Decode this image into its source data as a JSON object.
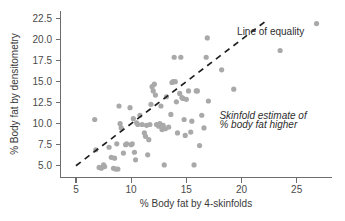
{
  "chart_data": {
    "type": "scatter",
    "title": "",
    "xlabel": "% Body fat by 4-skinfolds",
    "ylabel": "% Body fat by densitometry",
    "xlim": [
      3.6,
      28.2
    ],
    "ylim": [
      3.6,
      23.4
    ],
    "xticks": [
      5,
      10,
      15,
      20,
      25
    ],
    "xticklabels": [
      "5",
      "10",
      "15",
      "20",
      "25"
    ],
    "yticks": [
      5.0,
      7.5,
      10.0,
      12.5,
      15.0,
      17.5,
      20.0,
      22.5
    ],
    "yticklabels": [
      "5.0",
      "7.5",
      "10.0",
      "12.5",
      "15.0",
      "17.5",
      "20.0",
      "22.5"
    ],
    "grid": false,
    "legend": false,
    "marker_color": "#a9a9a9",
    "marker_size_px": 5.2,
    "annotations": [
      {
        "name": "line-of-equality-label",
        "text": "Line of equality",
        "x": 19.6,
        "y": 20.6,
        "style": "normal"
      },
      {
        "name": "skinfold-note-line-1",
        "text": "Skinfold estimate of",
        "x": 18.0,
        "y": 10.6,
        "style": "italic"
      },
      {
        "name": "skinfold-note-line-2",
        "text": "% body fat higher",
        "x": 18.0,
        "y": 9.5,
        "style": "italic"
      }
    ],
    "reference_line": {
      "name": "line-of-equality",
      "label": "Line of equality",
      "style": "dashed",
      "color": "#1f1f1f",
      "x_start": 5.0,
      "y_start": 5.0,
      "x_end": 22.4,
      "y_end": 22.4
    },
    "points": [
      [
        6.7,
        10.5
      ],
      [
        6.8,
        6.9
      ],
      [
        7.1,
        4.8
      ],
      [
        7.3,
        4.7
      ],
      [
        7.5,
        5.1
      ],
      [
        7.6,
        4.9
      ],
      [
        8.0,
        7.2
      ],
      [
        8.2,
        6.0
      ],
      [
        8.4,
        4.7
      ],
      [
        8.5,
        5.9
      ],
      [
        8.6,
        4.6
      ],
      [
        8.7,
        7.6
      ],
      [
        8.8,
        4.6
      ],
      [
        8.9,
        12.1
      ],
      [
        9.0,
        10.0
      ],
      [
        9.1,
        9.5
      ],
      [
        9.3,
        6.5
      ],
      [
        9.5,
        7.5
      ],
      [
        9.6,
        7.6
      ],
      [
        9.9,
        11.9
      ],
      [
        10.0,
        7.5
      ],
      [
        10.1,
        7.6
      ],
      [
        10.2,
        10.6
      ],
      [
        10.3,
        6.6
      ],
      [
        10.4,
        5.7
      ],
      [
        10.5,
        10.1
      ],
      [
        10.6,
        9.9
      ],
      [
        10.8,
        11.0
      ],
      [
        11.0,
        9.9
      ],
      [
        11.2,
        8.9
      ],
      [
        11.3,
        8.5
      ],
      [
        11.4,
        9.8
      ],
      [
        11.5,
        6.3
      ],
      [
        11.6,
        8.1
      ],
      [
        11.7,
        9.9
      ],
      [
        11.8,
        12.3
      ],
      [
        11.9,
        14.4
      ],
      [
        12.0,
        13.9
      ],
      [
        12.1,
        14.7
      ],
      [
        12.2,
        13.4
      ],
      [
        12.3,
        9.9
      ],
      [
        12.4,
        9.9
      ],
      [
        12.5,
        9.7
      ],
      [
        12.6,
        10.0
      ],
      [
        12.7,
        12.1
      ],
      [
        12.8,
        9.3
      ],
      [
        12.9,
        9.8
      ],
      [
        13.0,
        5.1
      ],
      [
        13.1,
        9.4
      ],
      [
        13.2,
        13.2
      ],
      [
        13.4,
        9.6
      ],
      [
        13.6,
        11.1
      ],
      [
        13.7,
        14.9
      ],
      [
        13.8,
        15.0
      ],
      [
        13.9,
        17.9
      ],
      [
        14.0,
        15.0
      ],
      [
        14.1,
        12.6
      ],
      [
        14.2,
        8.9
      ],
      [
        14.4,
        13.6
      ],
      [
        14.5,
        17.9
      ],
      [
        14.6,
        13.1
      ],
      [
        14.7,
        13.0
      ],
      [
        14.8,
        10.5
      ],
      [
        14.9,
        8.6
      ],
      [
        15.0,
        12.9
      ],
      [
        15.2,
        13.9
      ],
      [
        15.4,
        9.0
      ],
      [
        15.5,
        10.3
      ],
      [
        15.7,
        5.1
      ],
      [
        15.9,
        13.9
      ],
      [
        16.0,
        13.9
      ],
      [
        16.2,
        7.4
      ],
      [
        16.4,
        11.0
      ],
      [
        16.6,
        9.5
      ],
      [
        16.8,
        17.9
      ],
      [
        16.9,
        20.2
      ],
      [
        17.0,
        12.7
      ],
      [
        18.2,
        16.4
      ],
      [
        19.3,
        14.1
      ],
      [
        23.5,
        18.7
      ],
      [
        26.8,
        21.9
      ]
    ]
  },
  "axes": {
    "x_axis_name": "x-axis",
    "y_axis_name": "y-axis"
  }
}
